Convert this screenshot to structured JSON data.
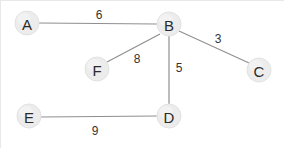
{
  "diagram": {
    "type": "undirected-weighted-graph",
    "title": "",
    "background_color": "#ffffff",
    "node_fill_color": "#ececec",
    "node_stroke_color": "#e2e2e2",
    "node_text_color": "#2b2b2b",
    "edge_color": "#8f8f8f",
    "weight_text_color": "#333333",
    "node_radius": 12,
    "nodes": [
      {
        "id": "A",
        "label": "A",
        "cx": 27,
        "cy": 23
      },
      {
        "id": "B",
        "label": "B",
        "cx": 169,
        "cy": 24
      },
      {
        "id": "C",
        "label": "C",
        "cx": 259,
        "cy": 70
      },
      {
        "id": "D",
        "label": "D",
        "cx": 169,
        "cy": 116
      },
      {
        "id": "E",
        "label": "E",
        "cx": 29,
        "cy": 116
      },
      {
        "id": "F",
        "label": "F",
        "cx": 97,
        "cy": 69
      }
    ],
    "edges": [
      {
        "from": "A",
        "to": "B",
        "weight": "6",
        "label_x": 99,
        "label_y": 15
      },
      {
        "from": "B",
        "to": "C",
        "weight": "3",
        "label_x": 218,
        "label_y": 39
      },
      {
        "from": "B",
        "to": "F",
        "weight": "8",
        "label_x": 137,
        "label_y": 59
      },
      {
        "from": "B",
        "to": "D",
        "weight": "5",
        "label_x": 179,
        "label_y": 68
      },
      {
        "from": "E",
        "to": "D",
        "weight": "9",
        "label_x": 95,
        "label_y": 131
      }
    ]
  }
}
